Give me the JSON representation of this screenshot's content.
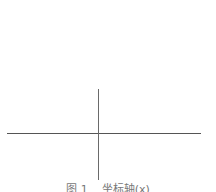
{
  "diagram": {
    "type": "coordinate-axes",
    "axes": {
      "horizontal": {
        "x1": 7,
        "x2": 201,
        "y": 133,
        "color": "#555555"
      },
      "vertical": {
        "x": 98,
        "y1": 89,
        "y2": 180,
        "color": "#6a6a6a"
      }
    },
    "caption": {
      "figure_number": "图 1",
      "text": "坐标轴(x)"
    }
  }
}
